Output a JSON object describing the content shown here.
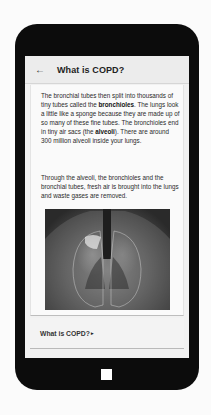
{
  "appbar": {
    "back_icon": "←",
    "title": "What is COPD?"
  },
  "content": {
    "paragraph1": {
      "t1": "The bronchial tubes then split into thousands of tiny tubes called the ",
      "b1": "bronchioles",
      "t2": ". The lungs look a little like a sponge because they are made up of so many of these fine tubes. The bronchioles end in tiny air sacs (the ",
      "b2": "alveoli",
      "t3": "). There are around 300 million alveoli inside your lungs."
    },
    "paragraph2": "Through the alveoli, the bronchioles and the bronchial tubes, fresh air is brought into the lungs and waste gases are removed.",
    "image": {
      "alt": "Illustration of human lungs and bronchial tubes inside the chest"
    }
  },
  "footer": {
    "link_label": "What is COPD?",
    "chevron_icon": "▸"
  },
  "device": {
    "home_button": "home-button"
  }
}
